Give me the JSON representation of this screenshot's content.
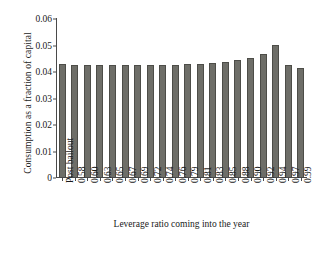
{
  "chart_data": {
    "type": "bar",
    "title": "",
    "xlabel": "Leverage ratio coming into the year",
    "ylabel": "Consumption as a fraction of capital",
    "categories": [
      "Post bailout",
      "0.58",
      "0.60",
      "0.63",
      "0.65",
      "0.67",
      "0.69",
      "0.72",
      "0.74",
      "0.76",
      "0.79",
      "0.81",
      "0.83",
      "0.85",
      "0.88",
      "0.90",
      "0.92",
      "0.94",
      "0.97",
      "0.99"
    ],
    "values": [
      0.0425,
      0.0423,
      0.0423,
      0.0423,
      0.0423,
      0.0423,
      0.0423,
      0.0423,
      0.0423,
      0.0424,
      0.0425,
      0.0427,
      0.043,
      0.0434,
      0.044,
      0.045,
      0.0466,
      0.05,
      0.0423,
      0.0412
    ],
    "ylim": [
      0,
      0.06
    ],
    "yticks": [
      0,
      0.01,
      0.02,
      0.03,
      0.04,
      0.05,
      0.06
    ],
    "ytick_labels": [
      "0",
      "0.01",
      "0.02",
      "0.03",
      "0.04",
      "0.05",
      "0.06"
    ],
    "grid": false,
    "legend": null,
    "bar_color": "#6e6e68",
    "bar_edge_color": "#4d4d48",
    "axis_color": "#4a4a4a",
    "background": "#ffffff"
  }
}
